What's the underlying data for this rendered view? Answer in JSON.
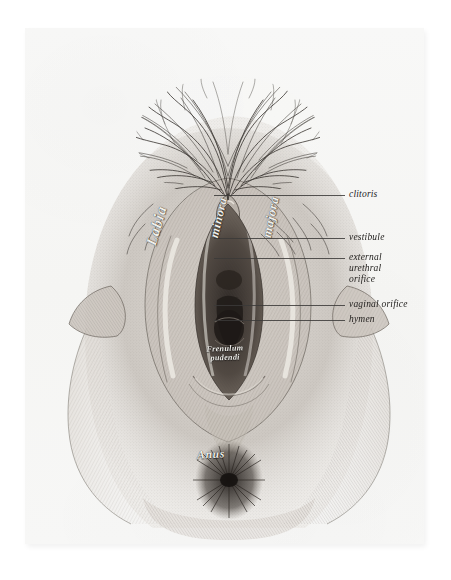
{
  "plate": {
    "kind": "anatomical-engraving",
    "subject": "external female genitalia / vulva",
    "background_color": "#f7f7f6",
    "ink_color": "#3b3a38",
    "page_color": "#ffffff"
  },
  "callouts": [
    {
      "id": "clitoris",
      "text": "clitoris",
      "line_y": 195,
      "line_x1": 214,
      "line_x2": 345,
      "label_x": 349,
      "label_y": 189
    },
    {
      "id": "vestibule",
      "text": "vestibule",
      "line_y": 238,
      "line_x1": 214,
      "line_x2": 345,
      "label_x": 349,
      "label_y": 232
    },
    {
      "id": "external-urethral-orifice",
      "text": "external\nurethral\norifice",
      "line_y": 258,
      "line_x1": 214,
      "line_x2": 345,
      "label_x": 349,
      "label_y": 250
    },
    {
      "id": "vaginal-orifice",
      "text": "vaginal orifice",
      "line_y": 305,
      "line_x1": 214,
      "line_x2": 345,
      "label_x": 349,
      "label_y": 299
    },
    {
      "id": "hymen",
      "text": "hymen",
      "line_y": 320,
      "line_x1": 214,
      "line_x2": 345,
      "label_x": 349,
      "label_y": 314
    }
  ],
  "inline_labels": {
    "labia": "Labia",
    "minora": "minora",
    "majora": "majora",
    "frenulum": "Frenulum\npudendi",
    "anus": "Anus"
  }
}
